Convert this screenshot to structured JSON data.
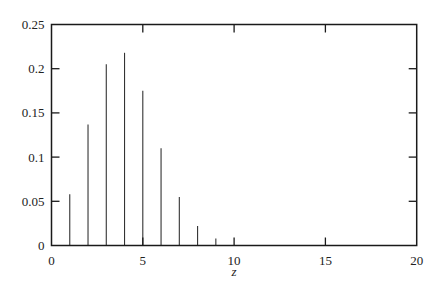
{
  "chart_data": {
    "type": "bar",
    "style": "stem",
    "title": "",
    "xlabel": "z",
    "ylabel": "",
    "xlim": [
      0,
      20
    ],
    "ylim": [
      0,
      0.25
    ],
    "grid": false,
    "legend": null,
    "x": [
      1,
      2,
      3,
      4,
      5,
      6,
      7,
      8,
      9
    ],
    "values": [
      0.058,
      0.137,
      0.205,
      0.218,
      0.175,
      0.11,
      0.055,
      0.022,
      0.008
    ],
    "x_ticks": [
      0,
      5,
      10,
      15,
      20
    ],
    "x_tick_labels": [
      "0",
      "5",
      "10",
      "15",
      "20"
    ],
    "y_ticks": [
      0,
      0.05,
      0.1,
      0.15,
      0.2,
      0.25
    ],
    "y_tick_labels": [
      "0",
      "0.05",
      "0.1",
      "0.15",
      "0.2",
      "0.25"
    ]
  },
  "colors": {
    "axis": "#1a1a1a",
    "stem": "#333333",
    "background": "#ffffff"
  }
}
